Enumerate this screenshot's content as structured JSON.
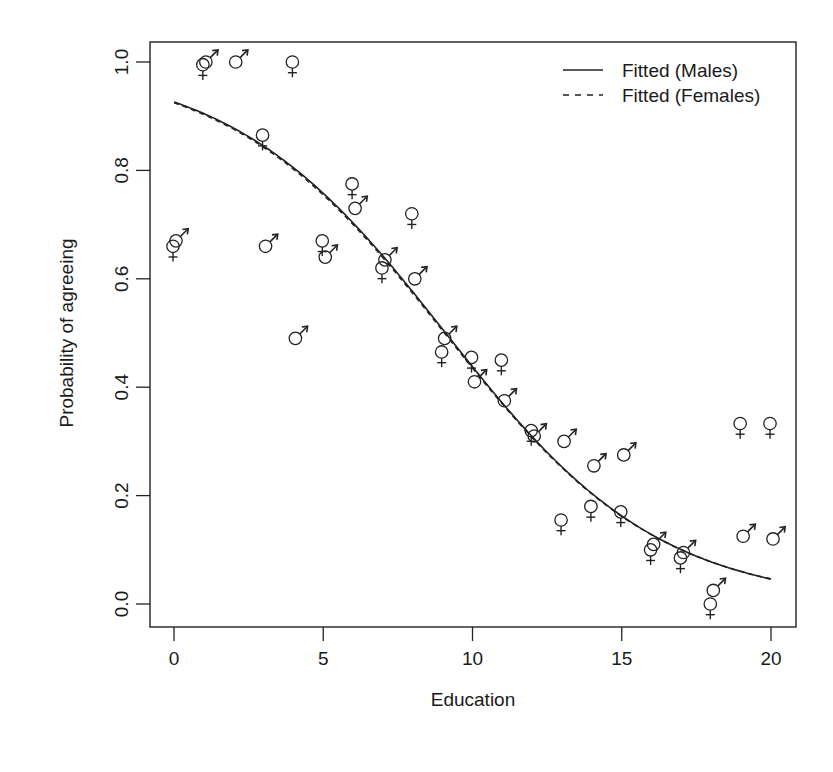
{
  "chart_data": {
    "type": "scatter",
    "title": "",
    "xlabel": "Education",
    "ylabel": "Probability of agreeing",
    "xlim": [
      -1,
      21
    ],
    "ylim": [
      -0.04,
      1.04
    ],
    "x_ticks": [
      0,
      5,
      10,
      15,
      20
    ],
    "x_tick_labels": [
      "0",
      "5",
      "10",
      "15",
      "20"
    ],
    "y_ticks": [
      0.0,
      0.2,
      0.4,
      0.6,
      0.8,
      1.0
    ],
    "y_tick_labels": [
      "0.0",
      "0.2",
      "0.4",
      "0.6",
      "0.8",
      "1.0"
    ],
    "grid": false,
    "legend": {
      "position": "top-right",
      "entries": [
        {
          "label": "Fitted (Males)",
          "line_style": "solid"
        },
        {
          "label": "Fitted (Females)",
          "line_style": "dashed"
        }
      ]
    },
    "series": [
      {
        "name": "Males (observed)",
        "marker": "male-symbol",
        "x": [
          0,
          1,
          2,
          3,
          4,
          5,
          6,
          7,
          8,
          9,
          10,
          11,
          12,
          13,
          14,
          15,
          16,
          17,
          18,
          19,
          20
        ],
        "y": [
          0.67,
          1.0,
          1.0,
          0.66,
          0.49,
          0.64,
          0.73,
          0.635,
          0.6,
          0.49,
          0.41,
          0.375,
          0.31,
          0.3,
          0.255,
          0.275,
          0.11,
          0.095,
          0.025,
          0.125,
          0.12
        ]
      },
      {
        "name": "Females (observed)",
        "marker": "female-symbol",
        "x": [
          0,
          1,
          3,
          4,
          5,
          6,
          7,
          8,
          9,
          10,
          11,
          12,
          13,
          14,
          15,
          16,
          17,
          18,
          19,
          20
        ],
        "y": [
          0.66,
          0.995,
          0.865,
          1.0,
          0.67,
          0.775,
          0.62,
          0.72,
          0.465,
          0.455,
          0.45,
          0.32,
          0.155,
          0.18,
          0.17,
          0.1,
          0.085,
          0.0,
          0.333,
          0.333
        ]
      },
      {
        "name": "Fitted (Males)",
        "type": "line",
        "line_style": "solid",
        "model": "logistic",
        "intercept": 2.53,
        "slope": -0.278,
        "x_range": [
          0,
          20
        ]
      },
      {
        "name": "Fitted (Females)",
        "type": "line",
        "line_style": "dashed",
        "model": "logistic",
        "intercept": 2.51,
        "slope": -0.277,
        "x_range": [
          0,
          20
        ]
      }
    ]
  }
}
